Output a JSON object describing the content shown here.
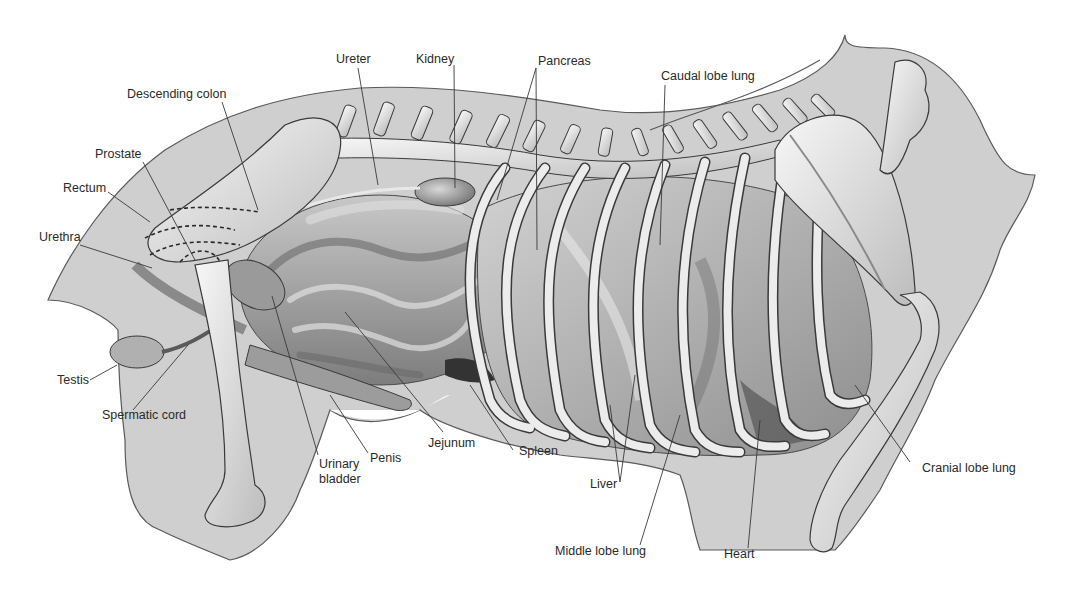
{
  "figure": {
    "colors": {
      "background": "#ffffff",
      "body_silhouette": "#cfcfcf",
      "outline": "#444444",
      "bone": "#ececec",
      "organ_dark": "#8a8a8a",
      "organ_mid": "#a9a9a9",
      "organ_light": "#c4c4c4",
      "label_text": "#2a2a2a",
      "leader_line": "#3a3a3a"
    }
  },
  "labels": {
    "ureter": "Ureter",
    "kidney": "Kidney",
    "pancreas": "Pancreas",
    "caudal_lobe_lung": "Caudal lobe lung",
    "descending_colon": "Descending colon",
    "prostate": "Prostate",
    "rectum": "Rectum",
    "urethra": "Urethra",
    "testis": "Testis",
    "spermatic_cord": "Spermatic cord",
    "urinary_bladder": "Urinary\nbladder",
    "penis": "Penis",
    "jejunum": "Jejunum",
    "spleen": "Spleen",
    "liver": "Liver",
    "middle_lobe_lung": "Middle lobe lung",
    "heart": "Heart",
    "cranial_lobe_lung": "Cranial lobe lung"
  }
}
